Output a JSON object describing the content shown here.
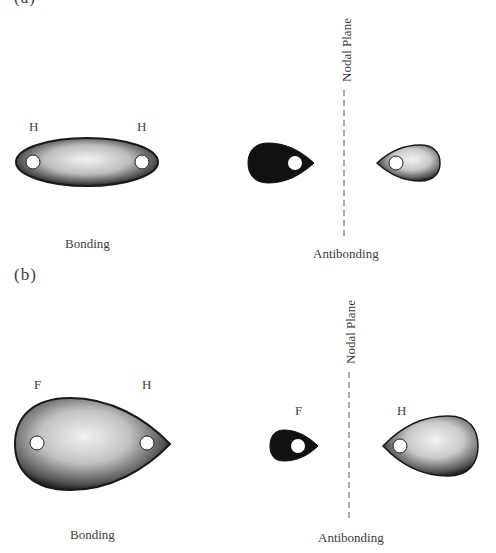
{
  "figure": {
    "panel_a": {
      "label": "(a)",
      "atoms": [
        "H",
        "H"
      ],
      "bonding_label": "Bonding",
      "antibonding_label": "Antibonding",
      "nodal_plane_label": "Nodal Plane"
    },
    "panel_b": {
      "label": "(b)",
      "bonding_atoms": [
        "F",
        "H"
      ],
      "antibonding_atoms": [
        "F",
        "H"
      ],
      "bonding_label": "Bonding",
      "antibonding_label": "Antibonding",
      "nodal_plane_label": "Nodal Plane"
    },
    "colors": {
      "dark_lobe": "#111111",
      "light_lobe_center": "#f2f2f2",
      "light_lobe_edge": "#3a3a3a",
      "outline": "#1a1a1a",
      "nucleus": "#ffffff",
      "dashed_line": "#555555"
    }
  }
}
